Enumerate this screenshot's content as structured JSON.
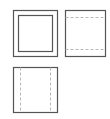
{
  "diagram": {
    "type": "engineering-drawing",
    "background_color": "#ffffff",
    "visible_line_color": "#555555",
    "hidden_line_color": "#b8b8b8",
    "visible_line_width": 1.2,
    "hidden_line_width": 1,
    "hidden_line_dash": "3,2",
    "canvas": {
      "width": 110,
      "height": 119
    },
    "views": [
      {
        "id": "front-view",
        "name": "front-view",
        "label": "Front view",
        "position": {
          "x": 13,
          "y": 10,
          "width": 44,
          "height": 46
        },
        "outer_rect": {
          "x": 13,
          "y": 10,
          "width": 44,
          "height": 46
        },
        "inner_rect": {
          "x": 18,
          "y": 15,
          "width": 34,
          "height": 36
        },
        "hidden_lines": []
      },
      {
        "id": "top-view",
        "name": "top-view",
        "label": "Top view",
        "position": {
          "x": 65,
          "y": 10,
          "width": 40,
          "height": 46
        },
        "outer_rect": {
          "x": 65,
          "y": 10,
          "width": 40,
          "height": 46
        },
        "inner_rect": null,
        "hidden_lines": [
          {
            "orientation": "horizontal",
            "x1": 65,
            "y1": 17,
            "x2": 105,
            "y2": 17
          },
          {
            "orientation": "horizontal",
            "x1": 65,
            "y1": 49,
            "x2": 105,
            "y2": 49
          }
        ]
      },
      {
        "id": "side-view",
        "name": "side-view",
        "label": "Side view",
        "position": {
          "x": 13,
          "y": 67,
          "width": 44,
          "height": 45
        },
        "outer_rect": {
          "x": 13,
          "y": 67,
          "width": 44,
          "height": 45
        },
        "inner_rect": null,
        "hidden_lines": [
          {
            "orientation": "vertical",
            "x1": 20,
            "y1": 67,
            "x2": 20,
            "y2": 112
          },
          {
            "orientation": "vertical",
            "x1": 50,
            "y1": 67,
            "x2": 50,
            "y2": 112
          }
        ]
      },
      {
        "id": "empty-quadrant",
        "name": "empty-quadrant",
        "label": "",
        "position": {
          "x": 65,
          "y": 67,
          "width": 40,
          "height": 45
        },
        "outer_rect": null,
        "inner_rect": null,
        "hidden_lines": []
      }
    ]
  }
}
